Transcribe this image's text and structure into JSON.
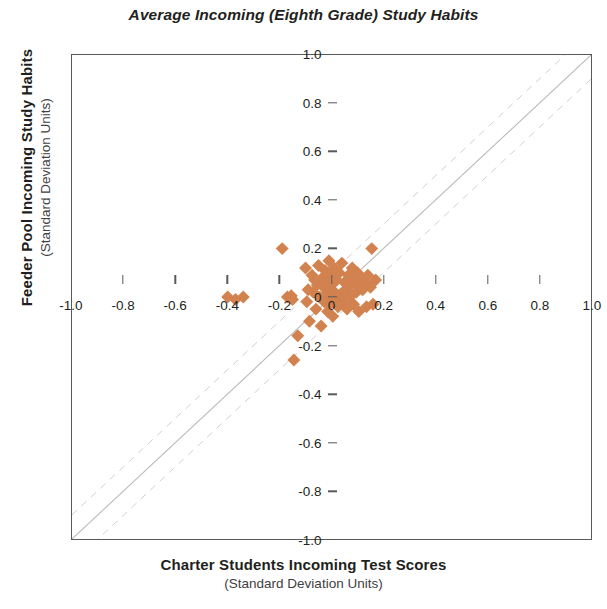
{
  "chart_data": {
    "type": "scatter",
    "title": "Average Incoming (Eighth Grade) Study Habits",
    "xlabel": "Charter Students Incoming Test Scores",
    "xlabel_sub": "(Standard Deviation Units)",
    "ylabel": "Feeder Pool Incoming Study Habits",
    "ylabel_sub": "(Standard Deviation Units)",
    "xlim": [
      -1.0,
      1.0
    ],
    "ylim": [
      -1.0,
      1.0
    ],
    "grid": false,
    "legend": "none",
    "marker": "diamond",
    "marker_color": "#d2824f",
    "marker_size": 13,
    "xticks": [
      "-1.0",
      "-0.8",
      "-0.6",
      "-0.4",
      "-0.2",
      "0",
      "0.2",
      "0.4",
      "0.6",
      "0.8",
      "1.0"
    ],
    "xtick_values": [
      -1.0,
      -0.8,
      -0.6,
      -0.4,
      -0.2,
      0,
      0.2,
      0.4,
      0.6,
      0.8,
      1.0
    ],
    "yticks": [
      "1.0",
      "0.8",
      "0.6",
      "0.4",
      "0.2",
      "0",
      "-0.2",
      "-0.4",
      "-0.6",
      "-0.8",
      "-1.0"
    ],
    "ytick_values": [
      1.0,
      0.8,
      0.6,
      0.4,
      0.2,
      0,
      -0.2,
      -0.4,
      -0.6,
      -0.8,
      -1.0
    ],
    "reference_lines": [
      {
        "name": "identity",
        "style": "solid",
        "color": "#b9babc",
        "slope": 1,
        "intercept": 0
      },
      {
        "name": "upper-band",
        "style": "dashed",
        "color": "#cfd0d2",
        "slope": 1,
        "intercept": 0.1
      },
      {
        "name": "lower-band",
        "style": "dashed",
        "color": "#cfd0d2",
        "slope": 1,
        "intercept": -0.1
      }
    ],
    "points": [
      [
        -0.4,
        0.0
      ],
      [
        -0.37,
        -0.01
      ],
      [
        -0.34,
        0.0
      ],
      [
        -0.19,
        0.2
      ],
      [
        -0.17,
        0.0
      ],
      [
        -0.155,
        0.005
      ],
      [
        -0.15,
        -0.01
      ],
      [
        -0.145,
        -0.26
      ],
      [
        -0.13,
        -0.16
      ],
      [
        -0.1,
        0.12
      ],
      [
        -0.095,
        -0.02
      ],
      [
        -0.09,
        0.03
      ],
      [
        -0.085,
        -0.1
      ],
      [
        -0.075,
        0.09
      ],
      [
        -0.07,
        0.02
      ],
      [
        -0.065,
        0.07
      ],
      [
        -0.06,
        -0.05
      ],
      [
        -0.055,
        0.05
      ],
      [
        -0.05,
        0.13
      ],
      [
        -0.045,
        0.0
      ],
      [
        -0.04,
        -0.12
      ],
      [
        -0.035,
        0.08
      ],
      [
        -0.03,
        0.04
      ],
      [
        -0.028,
        -0.02
      ],
      [
        -0.025,
        0.11
      ],
      [
        -0.02,
        0.01
      ],
      [
        -0.018,
        0.06
      ],
      [
        -0.015,
        -0.06
      ],
      [
        -0.012,
        0.03
      ],
      [
        -0.01,
        0.15
      ],
      [
        -0.008,
        -0.03
      ],
      [
        -0.005,
        0.09
      ],
      [
        -0.003,
        0.0
      ],
      [
        0.0,
        0.05
      ],
      [
        0.005,
        -0.08
      ],
      [
        0.01,
        0.12
      ],
      [
        0.012,
        0.02
      ],
      [
        0.015,
        -0.01
      ],
      [
        0.02,
        0.07
      ],
      [
        0.025,
        -0.04
      ],
      [
        0.03,
        0.1
      ],
      [
        0.035,
        0.01
      ],
      [
        0.04,
        0.14
      ],
      [
        0.045,
        -0.02
      ],
      [
        0.05,
        0.06
      ],
      [
        0.055,
        0.03
      ],
      [
        0.06,
        -0.05
      ],
      [
        0.065,
        0.09
      ],
      [
        0.07,
        0.0
      ],
      [
        0.075,
        0.05
      ],
      [
        0.08,
        0.12
      ],
      [
        0.085,
        -0.03
      ],
      [
        0.09,
        0.07
      ],
      [
        0.095,
        0.02
      ],
      [
        0.1,
        0.1
      ],
      [
        0.105,
        -0.06
      ],
      [
        0.11,
        0.05
      ],
      [
        0.115,
        0.08
      ],
      [
        0.12,
        0.03
      ],
      [
        0.13,
        0.06
      ],
      [
        0.135,
        -0.04
      ],
      [
        0.14,
        0.09
      ],
      [
        0.15,
        0.04
      ],
      [
        0.155,
        0.2
      ],
      [
        0.16,
        -0.03
      ],
      [
        0.17,
        0.07
      ]
    ]
  }
}
